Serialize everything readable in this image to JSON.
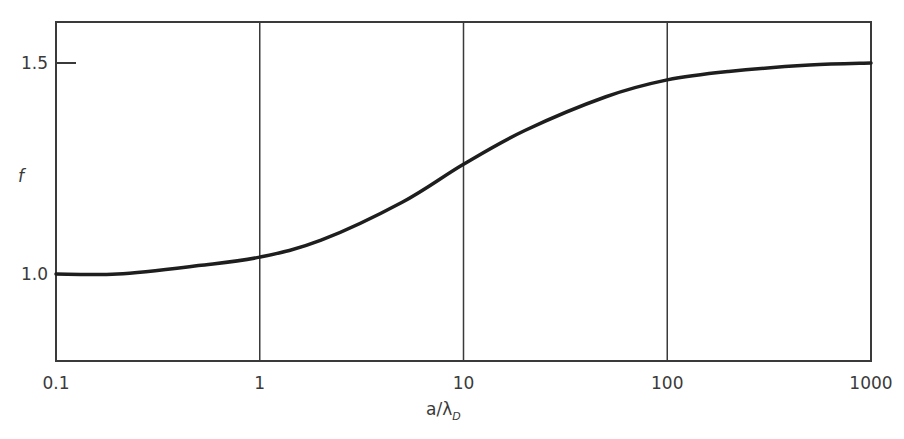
{
  "chart_data": {
    "type": "line",
    "title": "",
    "xlabel": "a/λ_D",
    "xlabel_main": "a/λ",
    "xlabel_sub": "D",
    "ylabel": "f",
    "x_scale": "log",
    "xlim": [
      0.1,
      1000
    ],
    "ylim": [
      0.8,
      1.6
    ],
    "x_ticks": [
      "0.1",
      "1",
      "10",
      "100",
      "1000"
    ],
    "y_ticks": [
      "1.0",
      "1.5"
    ],
    "grid": "vertical lines at each decade",
    "legend": "none",
    "series": [
      {
        "name": "f",
        "x": [
          0.1,
          0.2,
          0.5,
          1,
          2,
          5,
          10,
          20,
          50,
          100,
          200,
          500,
          1000
        ],
        "values": [
          1.0,
          1.0,
          1.02,
          1.04,
          1.08,
          1.17,
          1.26,
          1.34,
          1.42,
          1.46,
          1.48,
          1.495,
          1.5
        ]
      }
    ]
  },
  "colors": {
    "line": "#1e1e1e",
    "frame": "#3a3a3a",
    "text": "#3a3a3a",
    "background": "#ffffff"
  }
}
